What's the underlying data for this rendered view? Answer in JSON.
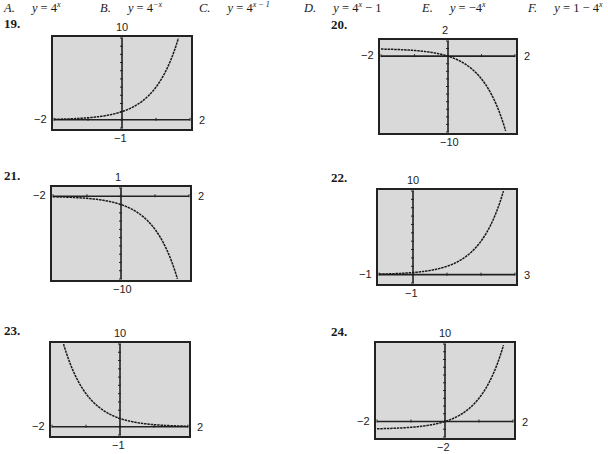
{
  "choices": [
    {
      "letter": "A.",
      "lhs": "y",
      "rhs": "4",
      "exp": "x",
      "tail": ""
    },
    {
      "letter": "B.",
      "lhs": "y",
      "rhs": "4",
      "exp": "−x",
      "tail": ""
    },
    {
      "letter": "C.",
      "lhs": "y",
      "rhs": "4",
      "exp": "x − 1",
      "tail": ""
    },
    {
      "letter": "D.",
      "lhs": "y",
      "rhs": "4",
      "exp": "x",
      "tail": " − 1"
    },
    {
      "letter": "E.",
      "lhs": "y",
      "rhs": "−4",
      "exp": "x",
      "tail": ""
    },
    {
      "letter": "F.",
      "lhs": "y",
      "rhs": "1 − 4",
      "exp": "x",
      "tail": ""
    }
  ],
  "chart_data": [
    {
      "type": "line",
      "title": "19.",
      "xmin": -2,
      "xmax": 2,
      "ymin": -1,
      "ymax": 10,
      "labels": {
        "top": "10",
        "bottom": "−1",
        "left": "−2",
        "right": "2"
      },
      "function": "4^x",
      "grid": false
    },
    {
      "type": "line",
      "title": "20.",
      "xmin": -2,
      "xmax": 2,
      "ymin": -10,
      "ymax": 2,
      "labels": {
        "top": "2",
        "bottom": "−10",
        "left": "−2",
        "right": "2"
      },
      "function": "1 - 4^x",
      "grid": false
    },
    {
      "type": "line",
      "title": "21.",
      "xmin": -2,
      "xmax": 2,
      "ymin": -10,
      "ymax": 1,
      "labels": {
        "top": "1",
        "bottom": "−10",
        "left": "−2",
        "right": "2"
      },
      "function": "-4^x",
      "grid": false
    },
    {
      "type": "line",
      "title": "22.",
      "xmin": -1,
      "xmax": 3,
      "ymin": -1,
      "ymax": 10,
      "labels": {
        "top": "10",
        "bottom": "−1",
        "left": "−1",
        "right": "3"
      },
      "function": "4^(x-1)",
      "grid": false
    },
    {
      "type": "line",
      "title": "23.",
      "xmin": -2,
      "xmax": 2,
      "ymin": -1,
      "ymax": 10,
      "labels": {
        "top": "10",
        "bottom": "−1",
        "left": "−2",
        "right": "2"
      },
      "function": "4^(-x)",
      "grid": false
    },
    {
      "type": "line",
      "title": "24.",
      "xmin": -2,
      "xmax": 2,
      "ymin": -2,
      "ymax": 10,
      "labels": {
        "top": "10",
        "bottom": "−2",
        "left": "−2",
        "right": "2"
      },
      "function": "4^x - 1",
      "grid": false
    }
  ],
  "colors": {
    "screen_bg": "#d9d9d9",
    "frame": "#222222",
    "curve": "#1a1a1a"
  }
}
